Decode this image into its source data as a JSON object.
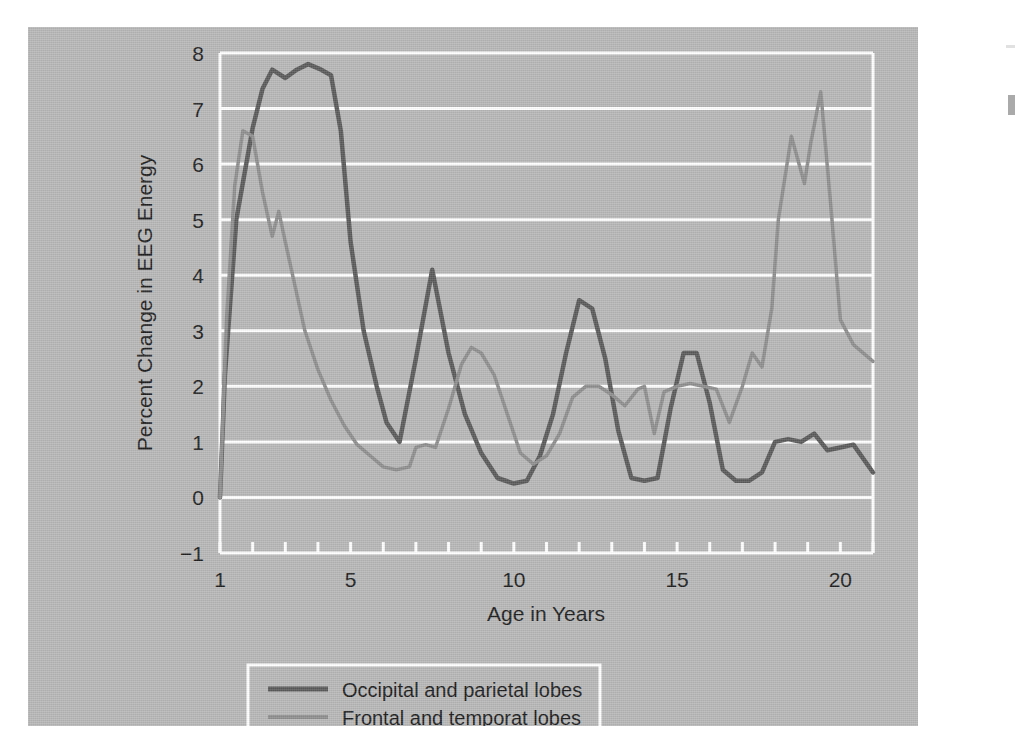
{
  "figure": {
    "panel_color": "#b7b7b7",
    "page_color": "#ffffff",
    "gridline_color": "#ffffff",
    "axis_color": "#ffffff"
  },
  "chart_data": {
    "type": "line",
    "title": "",
    "xlabel": "Age in Years",
    "ylabel": "Percent Change in EEG Energy",
    "xlim": [
      1,
      21
    ],
    "ylim": [
      -1,
      8
    ],
    "xticks": [
      1,
      2,
      3,
      4,
      5,
      6,
      7,
      8,
      9,
      10,
      11,
      12,
      13,
      14,
      15,
      16,
      17,
      18,
      19,
      20,
      21
    ],
    "xtick_labels": [
      "1",
      "",
      "",
      "",
      "5",
      "",
      "",
      "",
      "",
      "10",
      "",
      "",
      "",
      "",
      "15",
      "",
      "",
      "",
      "",
      "20",
      ""
    ],
    "xtick_labels_shown": [
      "1",
      "5",
      "10",
      "15",
      "20"
    ],
    "yticks": [
      -1,
      0,
      1,
      2,
      3,
      4,
      5,
      6,
      7,
      8
    ],
    "ytick_labels": [
      "−1",
      "0",
      "1",
      "2",
      "3",
      "4",
      "5",
      "6",
      "7",
      "8"
    ],
    "grid": "horizontal",
    "legend_position": "below-axes",
    "series": [
      {
        "name": "Occipital and parietal lobes",
        "color": "#5a5a5a",
        "width": 4.5,
        "x": [
          1.0,
          1.15,
          1.5,
          2.0,
          2.3,
          2.6,
          3.0,
          3.35,
          3.7,
          4.1,
          4.4,
          4.7,
          5.0,
          5.4,
          5.8,
          6.1,
          6.5,
          7.0,
          7.5,
          8.0,
          8.5,
          9.0,
          9.5,
          10.0,
          10.4,
          10.8,
          11.2,
          11.6,
          12.0,
          12.4,
          12.8,
          13.2,
          13.6,
          14.0,
          14.4,
          14.8,
          15.2,
          15.6,
          16.0,
          16.4,
          16.8,
          17.2,
          17.6,
          18.0,
          18.4,
          18.8,
          19.2,
          19.6,
          20.0,
          20.4,
          21.0
        ],
        "y": [
          0.0,
          2.2,
          5.0,
          6.65,
          7.35,
          7.7,
          7.55,
          7.7,
          7.8,
          7.7,
          7.6,
          6.6,
          4.6,
          3.0,
          2.0,
          1.35,
          1.0,
          2.5,
          4.1,
          2.6,
          1.5,
          0.8,
          0.35,
          0.25,
          0.3,
          0.75,
          1.5,
          2.6,
          3.55,
          3.4,
          2.5,
          1.2,
          0.35,
          0.3,
          0.35,
          1.6,
          2.6,
          2.6,
          1.7,
          0.5,
          0.3,
          0.3,
          0.45,
          1.0,
          1.05,
          1.0,
          1.15,
          0.85,
          0.9,
          0.95,
          0.45
        ]
      },
      {
        "name": "Frontal and temporat lobes",
        "color": "#8e8e8e",
        "width": 3.5,
        "x": [
          1.0,
          1.2,
          1.45,
          1.7,
          2.0,
          2.3,
          2.6,
          2.8,
          3.0,
          3.3,
          3.6,
          4.0,
          4.4,
          4.8,
          5.2,
          5.6,
          6.0,
          6.4,
          6.8,
          7.0,
          7.3,
          7.6,
          8.0,
          8.4,
          8.7,
          9.0,
          9.4,
          9.8,
          10.2,
          10.6,
          11.0,
          11.4,
          11.8,
          12.2,
          12.6,
          13.0,
          13.4,
          13.8,
          14.0,
          14.3,
          14.6,
          15.0,
          15.4,
          15.8,
          16.2,
          16.6,
          17.0,
          17.3,
          17.6,
          17.9,
          18.1,
          18.5,
          18.9,
          19.1,
          19.4,
          19.7,
          20.0,
          20.4,
          21.0
        ],
        "y": [
          0.0,
          3.2,
          5.6,
          6.6,
          6.5,
          5.5,
          4.7,
          5.15,
          4.6,
          3.8,
          3.0,
          2.3,
          1.75,
          1.3,
          0.95,
          0.75,
          0.55,
          0.5,
          0.55,
          0.9,
          0.95,
          0.9,
          1.6,
          2.4,
          2.7,
          2.6,
          2.2,
          1.5,
          0.8,
          0.6,
          0.75,
          1.15,
          1.8,
          2.0,
          2.0,
          1.85,
          1.65,
          1.95,
          2.0,
          1.15,
          1.9,
          2.0,
          2.05,
          2.0,
          1.95,
          1.35,
          2.0,
          2.6,
          2.35,
          3.4,
          5.0,
          6.5,
          5.65,
          6.4,
          7.3,
          5.3,
          3.2,
          2.75,
          2.45
        ]
      }
    ]
  },
  "legend": {
    "entries": [
      {
        "label": "Occipital and parietal lobes",
        "color": "#5a5a5a"
      },
      {
        "label": "Frontal and temporat lobes",
        "color": "#8e8e8e"
      }
    ]
  }
}
